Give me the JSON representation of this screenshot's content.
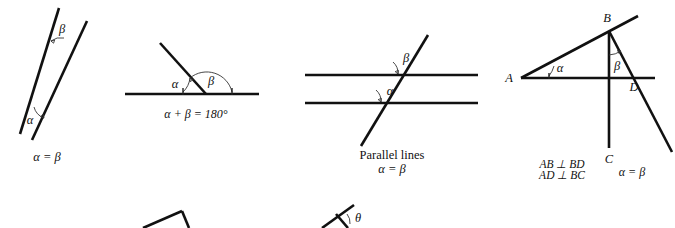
{
  "figure": {
    "background_color": "#ffffff",
    "line_color": "#111111",
    "width": 675,
    "height": 228
  },
  "diagrams": [
    {
      "id": "vertical-angles",
      "name": "Vertical angles",
      "angle_top_label": "β",
      "angle_bottom_label": "α",
      "caption": "α = β"
    },
    {
      "id": "supplementary-angles",
      "name": "Supplementary angles on a straight line",
      "angle_left_label": "α",
      "angle_right_label": "β",
      "caption": "α + β = 180°"
    },
    {
      "id": "parallel-lines",
      "name": "Parallel lines cut by a transversal",
      "angle_upper_label": "β",
      "angle_lower_label": "α",
      "caption_line1": "Parallel lines",
      "caption_line2": "α = β"
    },
    {
      "id": "perpendicular-sides",
      "name": "Angles with perpendicular sides",
      "point_a": "A",
      "point_b": "B",
      "point_c": "C",
      "point_d": "D",
      "angle_a_label": "α",
      "angle_b_label": "β",
      "caption_line1": "AB ⊥ BD",
      "caption_line2": "AD ⊥ BC",
      "caption_result": "α = β"
    },
    {
      "id": "partial-vertex-bottom-left",
      "name": "Partially visible angle vertex (cropped)",
      "label": ""
    },
    {
      "id": "partial-theta-bottom-right",
      "name": "Partially visible theta angle (cropped)",
      "label": "θ"
    }
  ]
}
